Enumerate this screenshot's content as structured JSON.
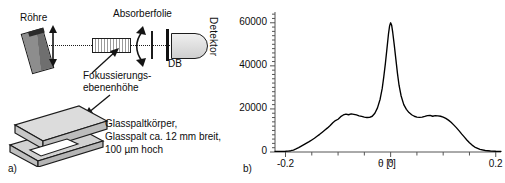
{
  "figure": {
    "panel_a_key": "a)",
    "panel_b_key": "b)"
  },
  "schematic": {
    "tube_label": "Röhre",
    "absorber_label": "Absorberfolie",
    "detector_label": "Detektor",
    "db_label": "DB",
    "focus_label_line1": "Fokussierungs-",
    "focus_label_line2": "ebenenhöhe",
    "glass_body_line1": "Glasspaltkörper,",
    "glass_body_line2": "Glasspalt ca. 12 mm breit,",
    "glass_body_line3": "100 µm hoch",
    "icons": {
      "tube": "xray-tube-icon",
      "beam": "beam-axis-icon",
      "slit": "glass-slit-icon",
      "foil": "absorber-foil-icon",
      "aperture": "db-aperture-icon",
      "detector": "detector-icon",
      "rotation_arrow": "double-arrow-icon",
      "pointer": "pointer-arrow-icon",
      "block": "glass-slit-body-3d-icon"
    },
    "colors": {
      "line": "#1a1a1a",
      "tube_fill": "#8d8d8d",
      "block_top": "#d9d9d9",
      "block_side": "#bfbfbf",
      "detector_fill": "#e3e3e3"
    }
  },
  "chart_data": {
    "type": "line",
    "title": "",
    "xlabel": "θ [°]",
    "ylabel": "",
    "xlim": [
      -0.22,
      0.21
    ],
    "ylim": [
      0,
      65000
    ],
    "grid": false,
    "legend": null,
    "xticks": [
      -0.2,
      0,
      0.2
    ],
    "xtick_labels": [
      "-0.2",
      "0",
      "0.2"
    ],
    "yticks": [
      0,
      20000,
      40000,
      60000
    ],
    "ytick_labels": [
      "0",
      "20000",
      "40000",
      "60000"
    ],
    "minor_xticks": [
      -0.15,
      -0.1,
      -0.05,
      0.05,
      0.1,
      0.15
    ],
    "axis_line_color": "#555555",
    "curve_color": "#000000",
    "x": [
      -0.22,
      -0.21,
      -0.2,
      -0.195,
      -0.19,
      -0.185,
      -0.18,
      -0.175,
      -0.17,
      -0.165,
      -0.16,
      -0.155,
      -0.15,
      -0.145,
      -0.14,
      -0.135,
      -0.13,
      -0.125,
      -0.12,
      -0.115,
      -0.11,
      -0.105,
      -0.1,
      -0.095,
      -0.09,
      -0.085,
      -0.08,
      -0.075,
      -0.07,
      -0.065,
      -0.06,
      -0.055,
      -0.05,
      -0.045,
      -0.04,
      -0.035,
      -0.03,
      -0.025,
      -0.02,
      -0.016,
      -0.013,
      -0.01,
      -0.007,
      -0.004,
      -0.002,
      0.0,
      0.002,
      0.004,
      0.007,
      0.01,
      0.013,
      0.016,
      0.02,
      0.025,
      0.03,
      0.035,
      0.04,
      0.045,
      0.05,
      0.055,
      0.06,
      0.065,
      0.07,
      0.075,
      0.08,
      0.085,
      0.09,
      0.095,
      0.1,
      0.105,
      0.11,
      0.115,
      0.12,
      0.125,
      0.13,
      0.135,
      0.14,
      0.145,
      0.15,
      0.155,
      0.16,
      0.17,
      0.18,
      0.19,
      0.2,
      0.21
    ],
    "y": [
      300,
      320,
      350,
      420,
      600,
      900,
      1400,
      2000,
      2700,
      3400,
      4100,
      4800,
      5600,
      6400,
      7300,
      8200,
      9200,
      10200,
      11200,
      12300,
      13600,
      14600,
      15200,
      16400,
      17200,
      17600,
      17300,
      17700,
      17500,
      17200,
      16800,
      16500,
      16200,
      16000,
      16100,
      16600,
      18000,
      20500,
      24500,
      29500,
      35000,
      41000,
      48000,
      55000,
      58500,
      60000,
      58800,
      55500,
      49500,
      43000,
      36500,
      31000,
      26000,
      22000,
      19800,
      18300,
      17300,
      16600,
      16200,
      16100,
      16200,
      16500,
      16900,
      17000,
      16600,
      16900,
      16800,
      16600,
      16200,
      15600,
      14800,
      13800,
      12600,
      11300,
      9900,
      8400,
      7000,
      5600,
      4300,
      3200,
      2300,
      1200,
      700,
      450,
      350,
      320
    ]
  }
}
